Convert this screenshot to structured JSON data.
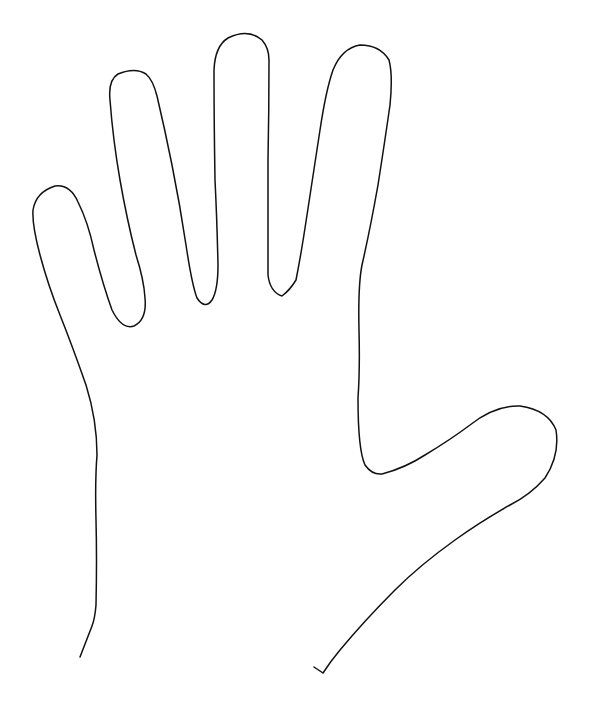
{
  "image": {
    "subject": "hand-outline",
    "background_color": "#ffffff",
    "stroke_color": "#111111",
    "stroke_width": 1.5
  }
}
